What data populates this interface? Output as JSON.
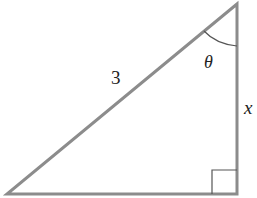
{
  "diagram": {
    "type": "right-triangle",
    "labels": {
      "hypotenuse": "3",
      "angle": "θ",
      "opposite_leg": "x"
    },
    "vertices": {
      "top": [
        237,
        4
      ],
      "bottom_left": [
        7,
        194
      ],
      "right_angle": [
        237,
        194
      ]
    },
    "colors": {
      "stroke": "#8c8c8c",
      "marker": "#555555",
      "text": "#222222"
    }
  }
}
